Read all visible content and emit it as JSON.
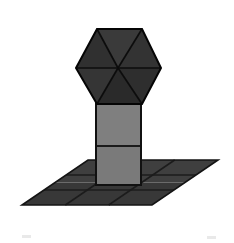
{
  "canvas": {
    "width": 234,
    "height": 243,
    "background": "#ffffff",
    "title": "3D shaded hexagonal column on grid ground plane"
  },
  "palette": {
    "background": "#ffffff",
    "outline": "#000000",
    "hex_face_a": "#3a3a3a",
    "hex_face_b": "#333333",
    "hex_face_c": "#2e2e2e",
    "hex_face_d": "#2a2a2a",
    "hex_face_e": "#353535",
    "hex_face_f": "#303030",
    "column_front": "#7f7f7f",
    "column_front_lower": "#7a7a7a",
    "column_side": "#5a5a5a",
    "ground_far": "#3f3f3f",
    "ground_near": "#383838",
    "ground_line": "#1c1c1c",
    "artifact": "#e9e9e9"
  },
  "objects": {
    "hexagon": {
      "name": "hexagonal-cap",
      "center": {
        "x": 118,
        "y": 68
      },
      "radius": 42,
      "vertices": [
        {
          "x": 97,
          "y": 29
        },
        {
          "x": 142,
          "y": 29
        },
        {
          "x": 161,
          "y": 68
        },
        {
          "x": 142,
          "y": 104
        },
        {
          "x": 97,
          "y": 104
        },
        {
          "x": 76,
          "y": 68
        }
      ],
      "triangle_count": 6,
      "shades": [
        "#3a3a3a",
        "#333333",
        "#2e2e2e",
        "#2a2a2a",
        "#353535",
        "#303030"
      ]
    },
    "column": {
      "name": "vertical-column",
      "left": 96,
      "right": 141,
      "top": 103,
      "bottom": 185,
      "divider_y": 146,
      "upper_shade": "#7f7f7f",
      "lower_shade": "#7a7a7a",
      "side_shade": "#5a5a5a"
    },
    "ground": {
      "name": "grid-ground-plane",
      "vertices": [
        {
          "x": 88,
          "y": 160
        },
        {
          "x": 218,
          "y": 160
        },
        {
          "x": 152,
          "y": 205
        },
        {
          "x": 22,
          "y": 205
        }
      ],
      "grid_rows": 3,
      "grid_cols": 3,
      "far_shade": "#3f3f3f",
      "near_shade": "#383838",
      "line_color": "#1c1c1c"
    }
  },
  "artifacts": [
    {
      "name": "bottom-left-speck",
      "x": 22,
      "y": 235,
      "width": 9,
      "height": 3
    },
    {
      "name": "bottom-right-speck",
      "x": 207,
      "y": 236,
      "width": 9,
      "height": 3
    }
  ]
}
